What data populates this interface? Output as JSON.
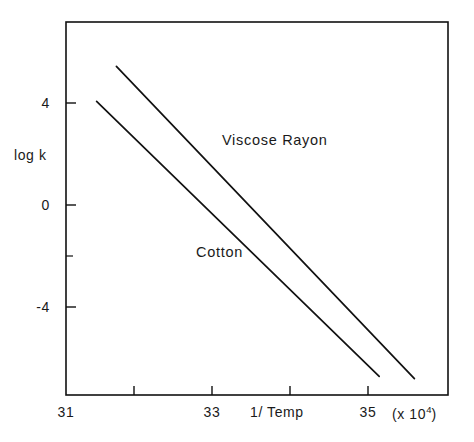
{
  "chart_data": {
    "type": "line",
    "title": "",
    "subtitle": "",
    "xlabel": "1/ Temp",
    "xlabel_note": "(x 10",
    "xlabel_note_exp": "4",
    "xlabel_note_tail": ")",
    "ylabel": "log k",
    "xlim": [
      31,
      36
    ],
    "ylim": [
      -8,
      8
    ],
    "xticks": [
      31,
      32,
      33,
      34,
      35,
      36
    ],
    "xtick_labels": [
      "31",
      "",
      "33",
      "",
      "35",
      ""
    ],
    "yticks": [
      4,
      0,
      -2,
      -4
    ],
    "ytick_labels": [
      "4",
      "0",
      "",
      "-4"
    ],
    "grid": false,
    "legend_position": "inline-annotations",
    "line_color": "#111111",
    "frame_color": "#111111",
    "series": [
      {
        "name": "Viscose Rayon",
        "label": "Viscose Rayon",
        "x": [
          31.66,
          35.56
        ],
        "values": [
          6.1,
          -7.3
        ],
        "label_x": 34.0,
        "label_y": 2.4
      },
      {
        "name": "Cotton",
        "label": "Cotton",
        "x": [
          31.4,
          35.1
        ],
        "values": [
          4.6,
          -7.2
        ],
        "label_x": 32.7,
        "label_y": -1.4
      }
    ]
  },
  "figure": {
    "background_color": "#ffffff",
    "axis_line_width": 1.4
  }
}
